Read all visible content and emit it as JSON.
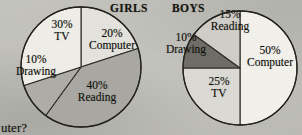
{
  "page": {
    "background_color": "#c3c2bd",
    "cut_off_text": "uter?"
  },
  "charts": [
    {
      "id": "girls",
      "title": "GIRLS",
      "center_x": 81,
      "center_y": 67,
      "radius": 60,
      "slices": [
        {
          "category": "Computer",
          "percent_label": "20%",
          "value": 20,
          "color": "#e4e3dd",
          "label_x": 112,
          "label_y": 40
        },
        {
          "category": "Reading",
          "percent_label": "40%",
          "value": 40,
          "color": "#a9a8a2",
          "label_x": 97,
          "label_y": 92
        },
        {
          "category": "Drawing",
          "percent_label": "10%",
          "value": 10,
          "color": "#aeada7",
          "label_x": 34,
          "label_y": 66
        },
        {
          "category": "TV",
          "percent_label": "30%",
          "value": 30,
          "color": "#efeee8",
          "label_x": 62,
          "label_y": 28
        }
      ]
    },
    {
      "id": "boys",
      "title": "BOYS",
      "center_x": 240,
      "center_y": 68,
      "radius": 57,
      "slices": [
        {
          "category": "Computer",
          "percent_label": "50%",
          "value": 50,
          "color": "#f2f1eb",
          "label_x": 268,
          "label_y": 57
        },
        {
          "category": "TV",
          "percent_label": "25%",
          "value": 25,
          "color": "#dbdad4",
          "label_x": 219,
          "label_y": 85
        },
        {
          "category": "Drawing",
          "percent_label": "10%",
          "value": 10,
          "color": "#6e6d68",
          "label_x": 186,
          "label_y": 41
        },
        {
          "category": "Reading",
          "percent_label": "15%",
          "value": 15,
          "color": "#cfcec8",
          "label_x": 229,
          "label_y": 17
        }
      ]
    }
  ],
  "chart_data": [
    {
      "type": "pie",
      "title": "GIRLS",
      "labels": [
        "Computer",
        "Reading",
        "Drawing",
        "TV"
      ],
      "values": [
        20,
        40,
        10,
        30
      ],
      "value_unit": "%",
      "colors": [
        "#e4e3dd",
        "#a9a8a2",
        "#aeada7",
        "#efeee8"
      ],
      "start_angle_deg": 0,
      "direction": "clockwise",
      "legend": "none",
      "grid": false
    },
    {
      "type": "pie",
      "title": "BOYS",
      "labels": [
        "Computer",
        "TV",
        "Drawing",
        "Reading"
      ],
      "values": [
        50,
        25,
        10,
        15
      ],
      "value_unit": "%",
      "colors": [
        "#f2f1eb",
        "#dbdad4",
        "#6e6d68",
        "#cfcec8"
      ],
      "start_angle_deg": 0,
      "direction": "clockwise",
      "legend": "none",
      "grid": false
    }
  ]
}
